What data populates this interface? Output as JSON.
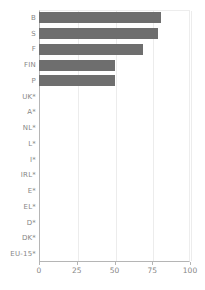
{
  "chart_data": {
    "type": "bar",
    "orientation": "horizontal",
    "title": "",
    "subtitle": "",
    "xlabel": "",
    "ylabel": "",
    "xlim": [
      0,
      100
    ],
    "xticks": [
      0,
      25,
      50,
      75,
      100
    ],
    "xtick_labels": [
      "0",
      "25",
      "50",
      "75",
      "100"
    ],
    "grid": true,
    "grid_axis": "x",
    "legend": false,
    "bar_color": "#6e6e6e",
    "grid_color": "#ececec",
    "axis_color": "#b5b5b5",
    "label_color": "#868686",
    "categories": [
      "B",
      "S",
      "F",
      "FIN",
      "P",
      "UK*",
      "A*",
      "NL*",
      "L*",
      "I*",
      "IRL*",
      "E*",
      "EL*",
      "D*",
      "DK*"
    ],
    "values": [
      81,
      79,
      69,
      50,
      50,
      0,
      0,
      0,
      0,
      0,
      0,
      0,
      0,
      0,
      0
    ],
    "extra_categories": [
      "EU-15*"
    ],
    "axis_categories": [
      "B",
      "S",
      "F",
      "FIN",
      "P",
      "UK*",
      "A*",
      "NL*",
      "L*",
      "I*",
      "IRL*",
      "E*",
      "EL*",
      "D*",
      "DK*",
      "EU-15*"
    ]
  }
}
